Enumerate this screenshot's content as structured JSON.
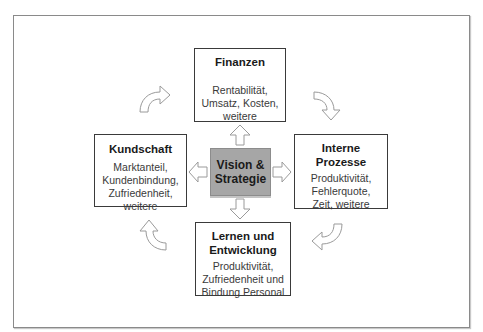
{
  "diagram": {
    "type": "balanced-scorecard",
    "center": {
      "label": "Vision &\nStrategie",
      "fill_color": "#a6a6a6"
    },
    "perspectives": {
      "top": {
        "title": "Finanzen",
        "items": "Rentabilität,\nUmsatz, Kosten,\nweitere"
      },
      "left": {
        "title": "Kundschaft",
        "items": "Marktanteil,\nKundenbindung,\nZufriedenheit,\nweitere"
      },
      "right": {
        "title": "Interne\nProzesse",
        "items": "Produktivität,\nFehlerquote,\nZeit, weitere"
      },
      "bottom": {
        "title": "Lernen und\nEntwicklung",
        "items": "Produktivität,\nZufriedenheit und\nBindung Personal"
      }
    },
    "connectors": {
      "straight_arrows": [
        "up",
        "left",
        "right",
        "down"
      ],
      "curved_arrows": [
        "top-left",
        "top-right",
        "bottom-right",
        "bottom-left"
      ],
      "arrow_stroke_color": "#9a9a9a",
      "box_border_color": "#3a3a3a",
      "frame_border_color": "#8a8a8a"
    }
  }
}
